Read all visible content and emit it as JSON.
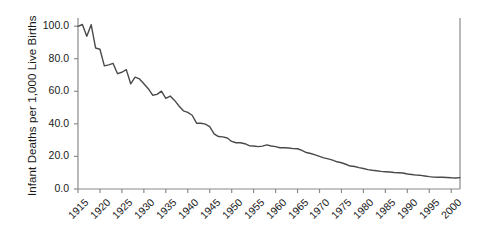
{
  "chart_data": {
    "type": "line",
    "title": "",
    "subtitle": "",
    "xlabel": "",
    "ylabel": "Infant Deaths per 1,000 Live Births",
    "xlim": [
      1915,
      2002
    ],
    "ylim": [
      0.0,
      105.0
    ],
    "grid": false,
    "legend": null,
    "legend_position": "none",
    "line_color": "#4a4a4a",
    "background_color": "#ffffff",
    "text_color": "#1a1a1a",
    "axis_color": "#8a8a8a",
    "yticks": [
      0.0,
      20.0,
      40.0,
      60.0,
      80.0,
      100.0
    ],
    "ytick_labels": [
      "0.0",
      "20.0",
      "40.0",
      "60.0",
      "80.0",
      "100.0"
    ],
    "xticks": [
      1915,
      1920,
      1925,
      1930,
      1935,
      1940,
      1945,
      1950,
      1955,
      1960,
      1965,
      1970,
      1975,
      1980,
      1985,
      1990,
      1995,
      2000
    ],
    "xtick_labels": [
      "1915",
      "1920",
      "1925",
      "1930",
      "1935",
      "1940",
      "1945",
      "1950",
      "1955",
      "1960",
      "1965",
      "1970",
      "1975",
      "1980",
      "1985",
      "1990",
      "1995",
      "2000"
    ],
    "series": [
      {
        "name": "Infant mortality rate",
        "x": [
          1915,
          1916,
          1917,
          1918,
          1919,
          1920,
          1921,
          1922,
          1923,
          1924,
          1925,
          1926,
          1927,
          1928,
          1929,
          1930,
          1931,
          1932,
          1933,
          1934,
          1935,
          1936,
          1937,
          1938,
          1939,
          1940,
          1941,
          1942,
          1943,
          1944,
          1945,
          1946,
          1947,
          1948,
          1949,
          1950,
          1951,
          1952,
          1953,
          1954,
          1955,
          1956,
          1957,
          1958,
          1959,
          1960,
          1961,
          1962,
          1963,
          1964,
          1965,
          1966,
          1967,
          1968,
          1969,
          1970,
          1971,
          1972,
          1973,
          1974,
          1975,
          1976,
          1977,
          1978,
          1979,
          1980,
          1981,
          1982,
          1983,
          1984,
          1985,
          1986,
          1987,
          1988,
          1989,
          1990,
          1991,
          1992,
          1993,
          1994,
          1995,
          1996,
          1997,
          1998,
          1999,
          2000,
          2001,
          2002
        ],
        "values": [
          99.9,
          101.0,
          93.8,
          100.9,
          86.6,
          85.8,
          75.6,
          76.2,
          77.1,
          70.8,
          71.7,
          73.3,
          64.6,
          68.7,
          67.6,
          64.6,
          61.6,
          57.6,
          58.1,
          60.1,
          55.7,
          57.1,
          54.4,
          51.0,
          48.0,
          47.0,
          45.3,
          40.4,
          40.4,
          39.8,
          38.3,
          33.8,
          32.2,
          32.0,
          31.3,
          29.2,
          28.4,
          28.4,
          27.8,
          26.6,
          26.4,
          26.0,
          26.3,
          27.1,
          26.4,
          26.0,
          25.3,
          25.3,
          25.2,
          24.8,
          24.7,
          23.7,
          22.4,
          21.8,
          20.9,
          20.0,
          19.1,
          18.5,
          17.7,
          16.7,
          16.1,
          15.2,
          14.1,
          13.8,
          13.1,
          12.6,
          11.9,
          11.5,
          11.2,
          10.8,
          10.6,
          10.4,
          10.1,
          10.0,
          9.8,
          9.2,
          8.9,
          8.5,
          8.4,
          8.0,
          7.6,
          7.3,
          7.2,
          7.2,
          7.1,
          6.9,
          6.8,
          7.0
        ]
      }
    ]
  },
  "figure": {
    "plot_left": 78,
    "plot_right": 460,
    "plot_top": 18,
    "plot_bottom": 189
  }
}
